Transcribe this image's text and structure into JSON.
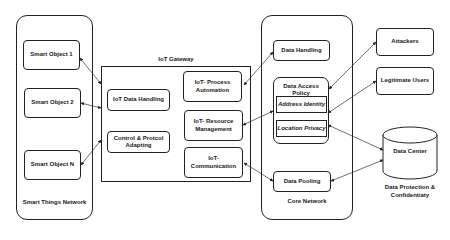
{
  "smart_things_network": {
    "label": "Smart Things Network",
    "objects": [
      "Smart Object 1",
      "Smart Object 2",
      "Smart Object N"
    ]
  },
  "iot_gateway": {
    "label": "IoT Gateway",
    "left_modules": [
      "IoT Data Handling",
      "Control & Protcol Adapting"
    ],
    "right_modules": [
      "IoT- Process Automation",
      "IoT- Resource Management",
      "IoT- Communication"
    ]
  },
  "core_network": {
    "label": "Core Network",
    "data_handling": "Data Handling",
    "data_access_policy": {
      "label": "Data Access Policy",
      "items": [
        "Address Identity",
        "Location Privacy"
      ]
    },
    "data_pooling": "Data Pooling"
  },
  "external": {
    "attackers": "Attackers",
    "legitimate_users": "Legitimate Users",
    "data_center": "Data Center",
    "data_center_caption": "Data Protection & Confidentiaty"
  }
}
